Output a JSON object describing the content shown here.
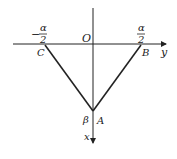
{
  "diagram": {
    "axes": {
      "horizontal": {
        "label": "y"
      },
      "vertical": {
        "label": "x"
      },
      "origin_label": "O"
    },
    "points": {
      "A": {
        "label": "A",
        "angle_label": "β"
      },
      "B": {
        "label": "B",
        "coord_label_num": "α",
        "coord_label_den": "2"
      },
      "C": {
        "label": "C",
        "coord_label_sign": "−",
        "coord_label_num": "α",
        "coord_label_den": "2"
      }
    },
    "colors": {
      "stroke": "#222222",
      "background": "#ffffff"
    }
  }
}
